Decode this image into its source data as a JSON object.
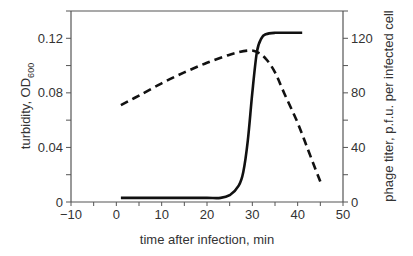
{
  "chart_data": {
    "type": "line",
    "title": "",
    "xlabel": "time after infection, min",
    "ylabel_left": "turbidity, OD",
    "ylabel_left_subscript": "600",
    "ylabel_right": "phage titer, p.f.u. per infected cell",
    "xlim": [
      -10,
      50
    ],
    "ylim_left": [
      0,
      0.14
    ],
    "ylim_right": [
      0,
      140
    ],
    "x_ticks": [
      "-10",
      "0",
      "10",
      "20",
      "30",
      "40",
      "50"
    ],
    "y_left_ticks": [
      "0",
      "0.04",
      "0.08",
      "0.12"
    ],
    "y_right_ticks": [
      "0",
      "40",
      "80",
      "120"
    ],
    "grid": false,
    "legend": null,
    "series": [
      {
        "name": "turbidity (OD600)",
        "axis": "left",
        "style": "dashed",
        "x": [
          1,
          5,
          10,
          15,
          20,
          25,
          29,
          31,
          33,
          35,
          37,
          40,
          43,
          45
        ],
        "y": [
          0.071,
          0.078,
          0.087,
          0.095,
          0.102,
          0.108,
          0.111,
          0.11,
          0.105,
          0.095,
          0.08,
          0.058,
          0.032,
          0.015
        ]
      },
      {
        "name": "phage titer (p.f.u. per infected cell)",
        "axis": "right",
        "style": "solid",
        "x": [
          1,
          5,
          10,
          15,
          20,
          23,
          25,
          27,
          28,
          29,
          30,
          31,
          32,
          33,
          35,
          38,
          41
        ],
        "y": [
          3,
          3,
          3,
          3,
          3,
          3,
          5,
          12,
          22,
          45,
          80,
          110,
          120,
          123,
          124,
          124,
          124
        ]
      }
    ]
  },
  "labels": {
    "xlabel": "time after infection, min",
    "ylabel_left": "turbidity, OD",
    "ylabel_left_sub": "600",
    "ylabel_right": "phage titer, p.f.u. per infected cell",
    "x_ticks": [
      "−10",
      "0",
      "10",
      "20",
      "30",
      "40",
      "50"
    ],
    "y_left_ticks": [
      "0",
      "0.04",
      "0.08",
      "0.12"
    ],
    "y_right_ticks": [
      "0",
      "40",
      "80",
      "120"
    ]
  }
}
